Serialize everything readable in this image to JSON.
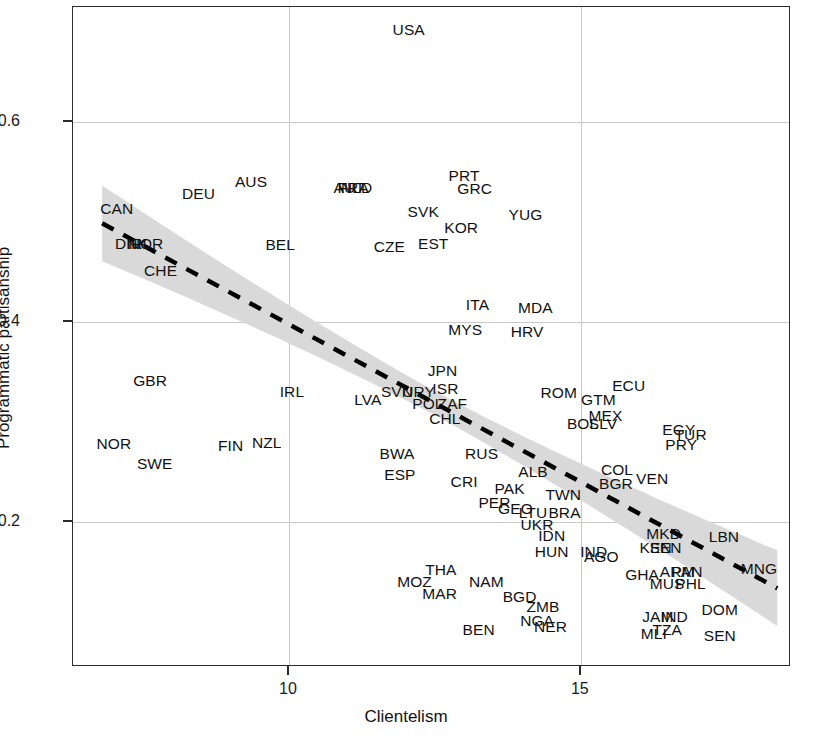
{
  "chart_data": {
    "type": "scatter",
    "title": "",
    "xlabel": "Clientelism",
    "ylabel": "Programmatic partisanship",
    "xlim": [
      6.3,
      18.6
    ],
    "ylim": [
      0.055,
      0.715
    ],
    "xticks": [
      10,
      15
    ],
    "xtick_labels": [
      "10",
      "15"
    ],
    "yticks": [
      0.2,
      0.4,
      0.6
    ],
    "ytick_labels": [
      "0.2",
      "0.4",
      "0.6"
    ],
    "grid": true,
    "legend": null,
    "point_label_type": "country-iso3",
    "fit": {
      "type": "linear-regression-dashed",
      "line_style": "dashed",
      "line_color": "#000000",
      "band_color": "#d9d9d9",
      "band_label": "confidence interval",
      "x_endpoints": [
        6.8,
        18.4
      ],
      "y_endpoints": [
        0.498,
        0.132
      ]
    },
    "points": [
      {
        "label": "USA",
        "x": 12.05,
        "y": 0.692
      },
      {
        "label": "AUS",
        "x": 9.35,
        "y": 0.54
      },
      {
        "label": "AUT",
        "x": 11.03,
        "y": 0.534
      },
      {
        "label": "FRA",
        "x": 11.1,
        "y": 0.534
      },
      {
        "label": "NLD",
        "x": 11.16,
        "y": 0.534
      },
      {
        "label": "PRT",
        "x": 13.0,
        "y": 0.546
      },
      {
        "label": "GRC",
        "x": 13.18,
        "y": 0.533
      },
      {
        "label": "DEU",
        "x": 8.45,
        "y": 0.528
      },
      {
        "label": "CAN",
        "x": 7.05,
        "y": 0.513
      },
      {
        "label": "SVK",
        "x": 12.3,
        "y": 0.51
      },
      {
        "label": "YUG",
        "x": 14.05,
        "y": 0.507
      },
      {
        "label": "KOR",
        "x": 12.95,
        "y": 0.494
      },
      {
        "label": "DNK",
        "x": 7.3,
        "y": 0.478
      },
      {
        "label": "IRL",
        "x": 7.43,
        "y": 0.478
      },
      {
        "label": "NOR",
        "x": 7.55,
        "y": 0.478
      },
      {
        "label": "BEL",
        "x": 9.85,
        "y": 0.477
      },
      {
        "label": "CZE",
        "x": 11.72,
        "y": 0.475
      },
      {
        "label": "EST",
        "x": 12.47,
        "y": 0.478
      },
      {
        "label": "CHE",
        "x": 7.8,
        "y": 0.451
      },
      {
        "label": "ITA",
        "x": 13.23,
        "y": 0.417
      },
      {
        "label": "MDA",
        "x": 14.22,
        "y": 0.414
      },
      {
        "label": "MYS",
        "x": 13.02,
        "y": 0.392
      },
      {
        "label": "HRV",
        "x": 14.08,
        "y": 0.39
      },
      {
        "label": "GBR",
        "x": 7.62,
        "y": 0.341
      },
      {
        "label": "JPN",
        "x": 12.63,
        "y": 0.351
      },
      {
        "label": "ECU",
        "x": 15.82,
        "y": 0.336
      },
      {
        "label": "ISR",
        "x": 12.68,
        "y": 0.333
      },
      {
        "label": "IRL2",
        "x": 10.05,
        "y": 0.33
      },
      {
        "label": "SVN",
        "x": 11.85,
        "y": 0.33
      },
      {
        "label": "URY",
        "x": 12.22,
        "y": 0.33
      },
      {
        "label": "ROM",
        "x": 14.62,
        "y": 0.329
      },
      {
        "label": "GTM",
        "x": 15.3,
        "y": 0.322
      },
      {
        "label": "LVA",
        "x": 11.35,
        "y": 0.322
      },
      {
        "label": "POL",
        "x": 12.38,
        "y": 0.318
      },
      {
        "label": "ZAF",
        "x": 12.8,
        "y": 0.318
      },
      {
        "label": "MEX",
        "x": 15.42,
        "y": 0.306
      },
      {
        "label": "CHL",
        "x": 12.67,
        "y": 0.303
      },
      {
        "label": "BOL",
        "x": 15.03,
        "y": 0.298
      },
      {
        "label": "SLV",
        "x": 15.38,
        "y": 0.298
      },
      {
        "label": "EGY",
        "x": 16.68,
        "y": 0.292
      },
      {
        "label": "TUR",
        "x": 16.88,
        "y": 0.287
      },
      {
        "label": "PRY",
        "x": 16.72,
        "y": 0.277
      },
      {
        "label": "NOR2",
        "x": 7.0,
        "y": 0.278
      },
      {
        "label": "FIN",
        "x": 9.0,
        "y": 0.276
      },
      {
        "label": "NZL",
        "x": 9.62,
        "y": 0.279
      },
      {
        "label": "BWA",
        "x": 11.85,
        "y": 0.268
      },
      {
        "label": "RUS",
        "x": 13.3,
        "y": 0.268
      },
      {
        "label": "SWE",
        "x": 7.7,
        "y": 0.258
      },
      {
        "label": "COL",
        "x": 15.62,
        "y": 0.252
      },
      {
        "label": "ALB",
        "x": 14.18,
        "y": 0.25
      },
      {
        "label": "ESP",
        "x": 11.9,
        "y": 0.247
      },
      {
        "label": "VEN",
        "x": 16.22,
        "y": 0.243
      },
      {
        "label": "BGR",
        "x": 15.6,
        "y": 0.238
      },
      {
        "label": "CRI",
        "x": 13.0,
        "y": 0.24
      },
      {
        "label": "PAK",
        "x": 13.78,
        "y": 0.233
      },
      {
        "label": "TWN",
        "x": 14.7,
        "y": 0.227
      },
      {
        "label": "PER",
        "x": 13.52,
        "y": 0.219
      },
      {
        "label": "GEO",
        "x": 13.88,
        "y": 0.213
      },
      {
        "label": "LTU",
        "x": 14.18,
        "y": 0.209
      },
      {
        "label": "BRA",
        "x": 14.72,
        "y": 0.209
      },
      {
        "label": "UKR",
        "x": 14.25,
        "y": 0.197
      },
      {
        "label": "MKD",
        "x": 16.42,
        "y": 0.188
      },
      {
        "label": "LBN",
        "x": 17.45,
        "y": 0.185
      },
      {
        "label": "IDN",
        "x": 14.5,
        "y": 0.186
      },
      {
        "label": "KEN",
        "x": 16.28,
        "y": 0.174
      },
      {
        "label": "SEN2",
        "x": 16.45,
        "y": 0.174
      },
      {
        "label": "HUN",
        "x": 14.5,
        "y": 0.17
      },
      {
        "label": "IND",
        "x": 15.22,
        "y": 0.17
      },
      {
        "label": "AGO",
        "x": 15.35,
        "y": 0.165
      },
      {
        "label": "MNG",
        "x": 18.05,
        "y": 0.153
      },
      {
        "label": "GHA",
        "x": 16.05,
        "y": 0.147
      },
      {
        "label": "ARM",
        "x": 16.65,
        "y": 0.15
      },
      {
        "label": "PAN",
        "x": 16.82,
        "y": 0.15
      },
      {
        "label": "THA",
        "x": 12.6,
        "y": 0.152
      },
      {
        "label": "MUS",
        "x": 16.48,
        "y": 0.138
      },
      {
        "label": "PHL",
        "x": 16.88,
        "y": 0.138
      },
      {
        "label": "MOZ",
        "x": 12.15,
        "y": 0.14
      },
      {
        "label": "NAM",
        "x": 13.38,
        "y": 0.14
      },
      {
        "label": "MAR",
        "x": 12.58,
        "y": 0.128
      },
      {
        "label": "BGD",
        "x": 13.95,
        "y": 0.125
      },
      {
        "label": "ZMB",
        "x": 14.35,
        "y": 0.115
      },
      {
        "label": "DOM",
        "x": 17.38,
        "y": 0.112
      },
      {
        "label": "JAM",
        "x": 16.32,
        "y": 0.105
      },
      {
        "label": "IND2",
        "x": 16.6,
        "y": 0.105
      },
      {
        "label": "NGA",
        "x": 14.25,
        "y": 0.101
      },
      {
        "label": "NER",
        "x": 14.48,
        "y": 0.095
      },
      {
        "label": "BEN",
        "x": 13.25,
        "y": 0.092
      },
      {
        "label": "MLI",
        "x": 16.25,
        "y": 0.088
      },
      {
        "label": "TZA",
        "x": 16.48,
        "y": 0.092
      },
      {
        "label": "SEN",
        "x": 17.38,
        "y": 0.086
      }
    ]
  },
  "axes": {
    "y_label": "Programmatic partisanship",
    "x_label": "Clientelism",
    "y_tick_labels": [
      "0.6",
      "0.4",
      "0.2"
    ],
    "x_tick_labels": [
      "10",
      "15"
    ]
  }
}
